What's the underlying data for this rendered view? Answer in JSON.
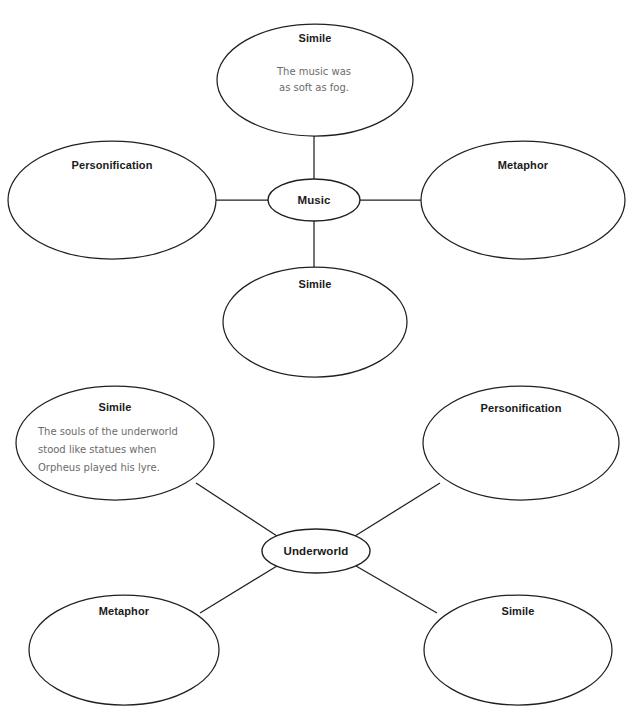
{
  "page": {
    "background_color": "#ffffff",
    "outline_color": "#231f20",
    "title_color": "#1a1a1a",
    "body_text_color": "#6b6b6b"
  },
  "diagrams": [
    {
      "name": "music-bubble-map",
      "center": {
        "label": "Music",
        "cx": 314,
        "cy": 200,
        "rx": 46,
        "ry": 21
      },
      "nodes": [
        {
          "id": "music-top",
          "label": "Simile",
          "lines": [
            "The music was",
            "as soft as fog."
          ],
          "cx": 315,
          "cy": 80,
          "rx": 98,
          "ry": 56,
          "title_y": 42,
          "body_start_y": 75,
          "body_line_height": 16,
          "body_x": 314,
          "align": "center"
        },
        {
          "id": "music-left",
          "label": "Personification",
          "lines": [],
          "cx": 112,
          "cy": 200,
          "rx": 104,
          "ry": 59,
          "title_y": 169,
          "body_start_y": 0,
          "body_line_height": 16,
          "body_x": 112,
          "align": "center"
        },
        {
          "id": "music-right",
          "label": "Metaphor",
          "lines": [],
          "cx": 523,
          "cy": 200,
          "rx": 102,
          "ry": 59,
          "title_y": 169,
          "body_start_y": 0,
          "body_line_height": 16,
          "body_x": 523,
          "align": "center"
        },
        {
          "id": "music-bottom",
          "label": "Simile",
          "lines": [],
          "cx": 315,
          "cy": 322,
          "rx": 92,
          "ry": 55,
          "title_y": 288,
          "body_start_y": 0,
          "body_line_height": 16,
          "body_x": 315,
          "align": "center"
        }
      ],
      "connectors": [
        {
          "id": "music-conn-top",
          "x1": 314,
          "y1": 136,
          "x2": 314,
          "y2": 180
        },
        {
          "id": "music-conn-left",
          "x1": 216,
          "y1": 200,
          "x2": 268,
          "y2": 200
        },
        {
          "id": "music-conn-right",
          "x1": 360,
          "y1": 200,
          "x2": 421,
          "y2": 200
        },
        {
          "id": "music-conn-bottom",
          "x1": 314,
          "y1": 221,
          "x2": 314,
          "y2": 268
        }
      ]
    },
    {
      "name": "underworld-bubble-map",
      "center": {
        "label": "Underworld",
        "cx": 316,
        "cy": 551,
        "rx": 54,
        "ry": 22
      },
      "nodes": [
        {
          "id": "underworld-top-left",
          "label": "Simile",
          "lines": [
            "The souls of the underworld",
            "stood like statues when",
            "Orpheus played his lyre."
          ],
          "cx": 115,
          "cy": 443,
          "rx": 99,
          "ry": 57,
          "title_y": 411,
          "body_start_y": 435,
          "body_line_height": 18,
          "body_x": 38,
          "align": "left"
        },
        {
          "id": "underworld-top-right",
          "label": "Personification",
          "lines": [],
          "cx": 521,
          "cy": 443,
          "rx": 98,
          "ry": 57,
          "title_y": 412,
          "body_start_y": 0,
          "body_line_height": 18,
          "body_x": 521,
          "align": "center"
        },
        {
          "id": "underworld-bottom-left",
          "label": "Metaphor",
          "lines": [],
          "cx": 124,
          "cy": 650,
          "rx": 95,
          "ry": 55,
          "title_y": 615,
          "body_start_y": 0,
          "body_line_height": 18,
          "body_x": 124,
          "align": "center"
        },
        {
          "id": "underworld-bottom-right",
          "label": "Simile",
          "lines": [],
          "cx": 518,
          "cy": 650,
          "rx": 94,
          "ry": 55,
          "title_y": 615,
          "body_start_y": 0,
          "body_line_height": 18,
          "body_x": 518,
          "align": "center"
        }
      ],
      "connectors": [
        {
          "id": "underworld-conn-top-left",
          "x1": 196,
          "y1": 483,
          "x2": 277,
          "y2": 536
        },
        {
          "id": "underworld-conn-top-right",
          "x1": 440,
          "y1": 483,
          "x2": 355,
          "y2": 536
        },
        {
          "id": "underworld-conn-bottom-left",
          "x1": 200,
          "y1": 613,
          "x2": 277,
          "y2": 566
        },
        {
          "id": "underworld-conn-bottom-right",
          "x1": 437,
          "y1": 613,
          "x2": 356,
          "y2": 566
        }
      ]
    }
  ]
}
